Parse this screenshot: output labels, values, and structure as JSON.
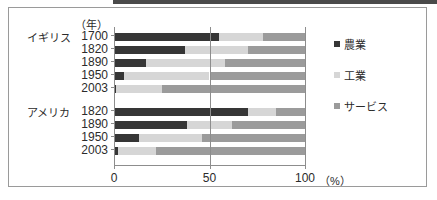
{
  "chart_data": {
    "type": "bar",
    "orientation": "horizontal",
    "stacked": true,
    "title": "",
    "xlabel": "(%)",
    "ylabel": "(年)",
    "xlim": [
      0,
      100
    ],
    "xticks": [
      0,
      50,
      100
    ],
    "xtick_labels": [
      "0",
      "50",
      "100"
    ],
    "grid": false,
    "gridline_at": 50,
    "legend_position": "right",
    "groups": [
      {
        "name": "イギリス",
        "categories": [
          "1700",
          "1820",
          "1890",
          "1950",
          "2003"
        ]
      },
      {
        "name": "アメリカ",
        "categories": [
          "1820",
          "1890",
          "1950",
          "2003"
        ]
      }
    ],
    "categories": [
      "1700",
      "1820",
      "1890",
      "1950",
      "2003",
      "1820",
      "1890",
      "1950",
      "2003"
    ],
    "series": [
      {
        "name": "農業",
        "color": "#363636",
        "values": [
          55,
          37,
          17,
          5,
          1,
          70,
          38,
          13,
          2
        ]
      },
      {
        "name": "工業",
        "color": "#d6d6d6",
        "values": [
          23,
          33,
          41,
          45,
          24,
          15,
          24,
          33,
          20
        ]
      },
      {
        "name": "サービス",
        "color": "#9b9b9b",
        "values": [
          22,
          30,
          42,
          50,
          75,
          15,
          38,
          54,
          78
        ]
      }
    ],
    "bars": [
      {
        "group": "イギリス",
        "year": "1700",
        "agri": 55,
        "indu": 23,
        "serv": 22
      },
      {
        "group": "イギリス",
        "year": "1820",
        "agri": 37,
        "indu": 33,
        "serv": 30
      },
      {
        "group": "イギリス",
        "year": "1890",
        "agri": 17,
        "indu": 41,
        "serv": 42
      },
      {
        "group": "イギリス",
        "year": "1950",
        "agri": 5,
        "indu": 45,
        "serv": 50
      },
      {
        "group": "イギリス",
        "year": "2003",
        "agri": 1,
        "indu": 24,
        "serv": 75
      },
      {
        "group": "アメリカ",
        "year": "1820",
        "agri": 70,
        "indu": 15,
        "serv": 15
      },
      {
        "group": "アメリカ",
        "year": "1890",
        "agri": 38,
        "indu": 24,
        "serv": 38
      },
      {
        "group": "アメリカ",
        "year": "1950",
        "agri": 13,
        "indu": 33,
        "serv": 54
      },
      {
        "group": "アメリカ",
        "year": "2003",
        "agri": 2,
        "indu": 20,
        "serv": 78
      }
    ]
  },
  "axis": {
    "year_unit": "（年）",
    "percent_unit": "（%）",
    "tick0": "0",
    "tick50": "50",
    "tick100": "100"
  },
  "legend": {
    "items": [
      {
        "label": "農業",
        "key": "agri",
        "color": "#363636"
      },
      {
        "label": "工業",
        "key": "indu",
        "color": "#d6d6d6"
      },
      {
        "label": "サービス",
        "key": "serv",
        "color": "#9b9b9b"
      }
    ]
  },
  "group_labels": {
    "uk": "イギリス",
    "us": "アメリカ"
  },
  "year_labels": {
    "uk": [
      "1700",
      "1820",
      "1890",
      "1950",
      "2003"
    ],
    "us": [
      "1820",
      "1890",
      "1950",
      "2003"
    ]
  }
}
